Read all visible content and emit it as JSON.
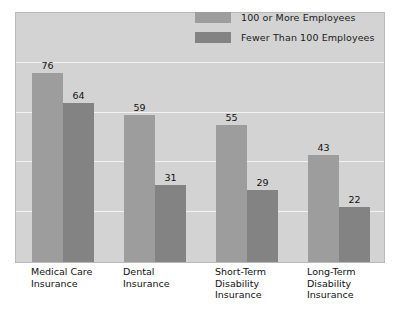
{
  "chart_data": {
    "type": "bar",
    "title": "",
    "subtitle": "",
    "xlabel": "",
    "ylabel": "",
    "grid": true,
    "legend_position": "top-right",
    "ylim": [
      0,
      100
    ],
    "gridline_values": [
      20,
      40,
      60,
      80
    ],
    "categories": [
      "Medical Care\nInsurance",
      "Dental\nInsurance",
      "Short-Term\nDisability\nInsurance",
      "Long-Term\nDisability\nInsurance"
    ],
    "category_lines": [
      [
        "Medical Care",
        "Insurance"
      ],
      [
        "Dental",
        "Insurance"
      ],
      [
        "Short-Term",
        "Disability",
        "Insurance"
      ],
      [
        "Long-Term",
        "Disability",
        "Insurance"
      ]
    ],
    "series": [
      {
        "name": "100 or More Employees",
        "color": "#9d9d9d",
        "values": [
          76,
          59,
          55,
          43
        ]
      },
      {
        "name": "Fewer Than 100 Employees",
        "color": "#838383",
        "values": [
          64,
          31,
          29,
          22
        ]
      }
    ]
  },
  "legend": {
    "items": [
      {
        "label": "100 or More Employees",
        "color": "#9d9d9d"
      },
      {
        "label": "Fewer Than 100 Employees",
        "color": "#838383"
      }
    ]
  },
  "style": {
    "plot_background": "#d3d3d3",
    "page_background": "#ffffff",
    "gridline_color": "#f2f2f2",
    "border_color": "#b9b9b9",
    "text_color": "#111111"
  }
}
